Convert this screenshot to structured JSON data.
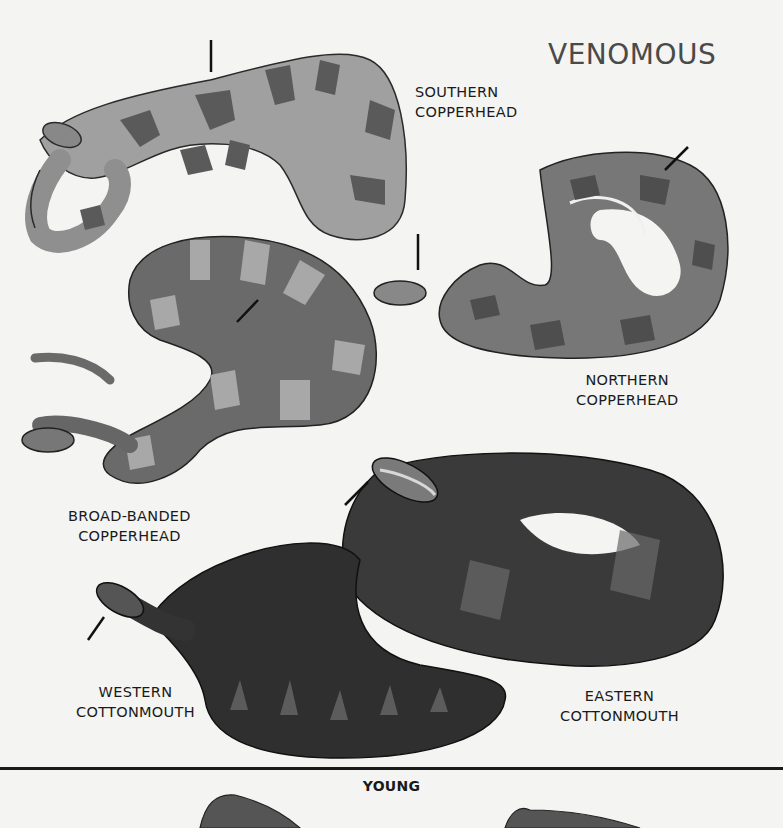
{
  "page": {
    "heading": "VENOMOUS",
    "section_young": "YOUNG"
  },
  "species": [
    {
      "id": "southern-copperhead",
      "line1": "SOUTHERN",
      "line2": "COPPERHEAD"
    },
    {
      "id": "northern-copperhead",
      "line1": "NORTHERN",
      "line2": "COPPERHEAD"
    },
    {
      "id": "broad-banded-copperhead",
      "line1": "BROAD-BANDED",
      "line2": "COPPERHEAD"
    },
    {
      "id": "western-cottonmouth",
      "line1": "WESTERN",
      "line2": "COTTONMOUTH"
    },
    {
      "id": "eastern-cottonmouth",
      "line1": "EASTERN",
      "line2": "COTTONMOUTH"
    }
  ],
  "colors": {
    "paper": "#f4f4f2",
    "copperhead_light": "#9c9c9c",
    "copperhead_dark": "#555555",
    "cottonmouth": "#2e2e2e",
    "ink": "#1a1a1a"
  }
}
